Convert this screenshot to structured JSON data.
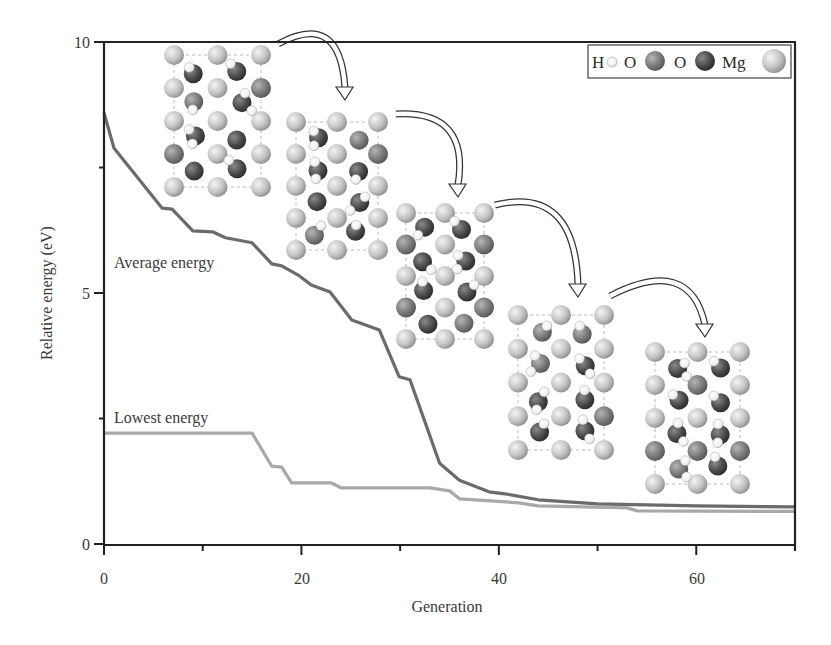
{
  "chart_data": {
    "type": "line",
    "title": "",
    "xlabel": "Generation",
    "ylabel": "Relative energy (eV)",
    "xlim": [
      0,
      70
    ],
    "ylim": [
      0,
      10
    ],
    "x_ticks": [
      0,
      20,
      40,
      60
    ],
    "x_minor_ticks": [
      10,
      30,
      50
    ],
    "y_ticks": [
      0,
      5,
      10
    ],
    "y_minor_ticks": [
      2.5,
      7.5
    ],
    "grid": false,
    "series": [
      {
        "name": "Average energy",
        "color": "#6b6b6b",
        "x": [
          0,
          1,
          5.9,
          6.9,
          9,
          11,
          12.3,
          15,
          17,
          18,
          19.8,
          21,
          22.9,
          25.1,
          27.9,
          29.9,
          31,
          34,
          36,
          39,
          40.6,
          44,
          50,
          60,
          70
        ],
        "values": [
          8.59,
          7.89,
          6.69,
          6.67,
          6.24,
          6.22,
          6.1,
          6.0,
          5.58,
          5.54,
          5.34,
          5.16,
          5.02,
          4.46,
          4.26,
          3.33,
          3.27,
          1.61,
          1.27,
          1.04,
          1.0,
          0.88,
          0.8,
          0.76,
          0.74
        ]
      },
      {
        "name": "Lowest energy",
        "color": "#a9a9a9",
        "x": [
          0,
          15,
          17,
          18,
          19,
          23,
          24,
          33,
          35,
          36,
          42,
          44,
          53,
          54,
          70
        ],
        "values": [
          2.21,
          2.21,
          1.55,
          1.53,
          1.22,
          1.22,
          1.12,
          1.12,
          1.06,
          0.9,
          0.82,
          0.76,
          0.72,
          0.66,
          0.65
        ]
      }
    ],
    "annotations": [
      {
        "text": "Average energy",
        "x": 1,
        "y": 5.6
      },
      {
        "text": "Lowest energy",
        "x": 1,
        "y": 2.45
      }
    ],
    "legend": {
      "position": "top-right",
      "entries": [
        {
          "label": "H",
          "atom": "hydrogen",
          "color": "#f2f2f2"
        },
        {
          "label": "O",
          "atom": "oxygen-light",
          "color": "#7d7d7d"
        },
        {
          "label": "O",
          "atom": "oxygen-dark",
          "color": "#4a4a4a"
        },
        {
          "label": "Mg",
          "atom": "magnesium",
          "color": "#c8c8c8"
        }
      ]
    },
    "inset_structures": 5,
    "inset_arrows": 4
  },
  "labels": {
    "xlabel": "Generation",
    "ylabel": "Relative energy (eV)",
    "avg": "Average energy",
    "low": "Lowest energy",
    "xt0": "0",
    "xt1": "20",
    "xt2": "40",
    "xt3": "60",
    "yt0": "0",
    "yt1": "5",
    "yt2": "10",
    "leg_h": "H",
    "leg_o1": "O",
    "leg_o2": "O",
    "leg_mg": "Mg"
  }
}
